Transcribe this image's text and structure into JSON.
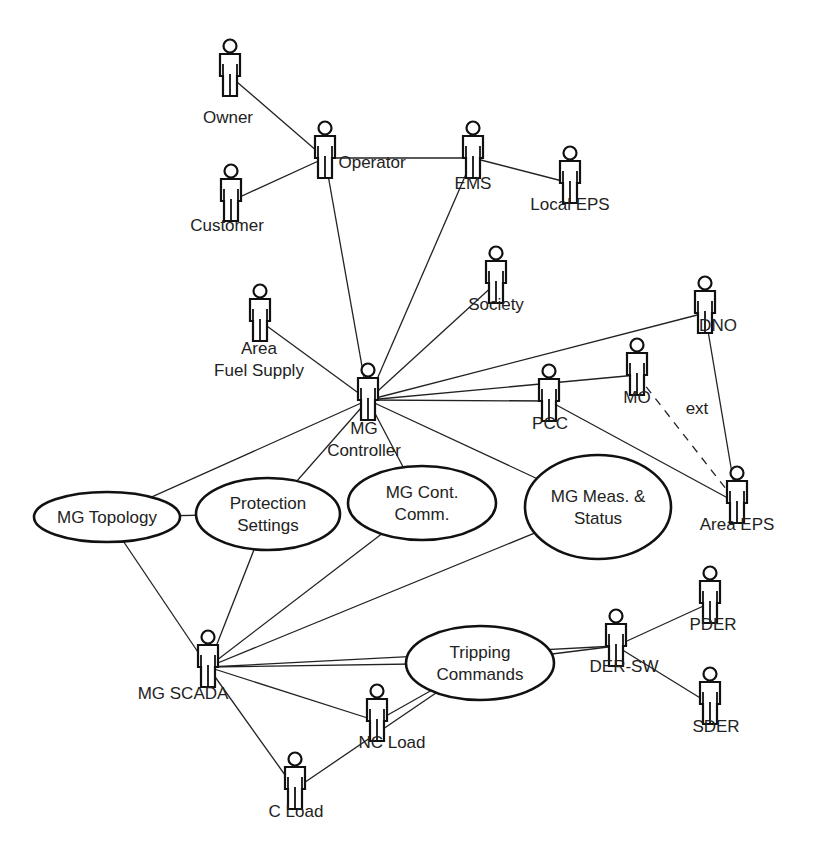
{
  "actors": [
    {
      "id": "owner",
      "label": [
        "Owner"
      ],
      "x": 230,
      "y": 38,
      "lx": 228,
      "ly": 123
    },
    {
      "id": "operator",
      "label": [
        "Operator"
      ],
      "x": 325,
      "y": 120,
      "lx": 372,
      "ly": 168
    },
    {
      "id": "customer",
      "label": [
        "Customer"
      ],
      "x": 231,
      "y": 163,
      "lx": 227,
      "ly": 231
    },
    {
      "id": "ems",
      "label": [
        "EMS"
      ],
      "x": 473,
      "y": 120,
      "lx": 473,
      "ly": 189
    },
    {
      "id": "local-eps",
      "label": [
        "Local EPS"
      ],
      "x": 570,
      "y": 145,
      "lx": 570,
      "ly": 210
    },
    {
      "id": "society",
      "label": [
        "Society"
      ],
      "x": 496,
      "y": 245,
      "lx": 496,
      "ly": 310
    },
    {
      "id": "dno",
      "label": [
        "DNO"
      ],
      "x": 705,
      "y": 275,
      "lx": 718,
      "ly": 331
    },
    {
      "id": "area-fuel-supply",
      "label": [
        "Area",
        "Fuel Supply"
      ],
      "x": 260,
      "y": 283,
      "lx": 259,
      "ly": 354
    },
    {
      "id": "mg-controller",
      "label": [
        "MG",
        "Controller"
      ],
      "x": 368,
      "y": 362,
      "lx": 364,
      "ly": 434
    },
    {
      "id": "mo",
      "label": [
        "MO"
      ],
      "x": 637,
      "y": 337,
      "lx": 637,
      "ly": 403
    },
    {
      "id": "pcc",
      "label": [
        "PCC"
      ],
      "x": 549,
      "y": 363,
      "lx": 550,
      "ly": 429
    },
    {
      "id": "area-eps",
      "label": [
        "Area EPS"
      ],
      "x": 737,
      "y": 465,
      "lx": 737,
      "ly": 530
    },
    {
      "id": "pder",
      "label": [
        "PDER"
      ],
      "x": 710,
      "y": 565,
      "lx": 713,
      "ly": 630
    },
    {
      "id": "mg-scada",
      "label": [
        "MG SCADA"
      ],
      "x": 208,
      "y": 629,
      "lx": 183,
      "ly": 699
    },
    {
      "id": "der-sw",
      "label": [
        "DER-SW"
      ],
      "x": 616,
      "y": 608,
      "lx": 624,
      "ly": 672
    },
    {
      "id": "nc-load",
      "label": [
        "NC Load"
      ],
      "x": 377,
      "y": 683,
      "lx": 392,
      "ly": 748
    },
    {
      "id": "sder",
      "label": [
        "SDER"
      ],
      "x": 710,
      "y": 666,
      "lx": 716,
      "ly": 732
    },
    {
      "id": "c-load",
      "label": [
        "C Load"
      ],
      "x": 295,
      "y": 751,
      "lx": 296,
      "ly": 817
    }
  ],
  "use_cases": [
    {
      "id": "mg-topology",
      "label": [
        "MG Topology"
      ],
      "cx": 107,
      "cy": 517,
      "rx": 73,
      "ry": 25
    },
    {
      "id": "protection-settings",
      "label": [
        "Protection",
        "Settings"
      ],
      "cx": 268,
      "cy": 514,
      "rx": 72,
      "ry": 36
    },
    {
      "id": "mg-cont-comm",
      "label": [
        "MG Cont.",
        "Comm."
      ],
      "cx": 422,
      "cy": 503,
      "rx": 74,
      "ry": 37
    },
    {
      "id": "mg-meas-status",
      "label": [
        "MG Meas. &",
        "Status"
      ],
      "cx": 598,
      "cy": 507,
      "rx": 73,
      "ry": 52
    },
    {
      "id": "tripping-commands",
      "label": [
        "Tripping",
        "Commands"
      ],
      "cx": 480,
      "cy": 663,
      "rx": 74,
      "ry": 37
    }
  ],
  "edges": [
    {
      "from": "owner",
      "to": "operator"
    },
    {
      "from": "customer",
      "to": "operator"
    },
    {
      "from": "operator",
      "to": "ems"
    },
    {
      "from": "ems",
      "to": "local-eps"
    },
    {
      "from": "operator",
      "to": "mg-controller"
    },
    {
      "from": "ems",
      "to": "mg-controller"
    },
    {
      "from": "society",
      "to": "mg-controller"
    },
    {
      "from": "area-fuel-supply",
      "to": "mg-controller"
    },
    {
      "from": "dno",
      "to": "mg-controller"
    },
    {
      "from": "mo",
      "to": "mg-controller"
    },
    {
      "from": "pcc",
      "to": "mg-controller"
    },
    {
      "from": "dno",
      "to": "area-eps"
    },
    {
      "from": "pcc",
      "to": "area-eps"
    },
    {
      "from": "mo",
      "to": "area-eps",
      "style": "dashed",
      "label": "ext"
    },
    {
      "from": "mg-controller",
      "to": "mg-topology"
    },
    {
      "from": "mg-controller",
      "to": "protection-settings"
    },
    {
      "from": "mg-controller",
      "to": "mg-cont-comm"
    },
    {
      "from": "mg-controller",
      "to": "mg-meas-status"
    },
    {
      "from": "mg-topology",
      "to": "protection-settings"
    },
    {
      "from": "mg-topology",
      "to": "mg-scada"
    },
    {
      "from": "protection-settings",
      "to": "mg-scada"
    },
    {
      "from": "mg-cont-comm",
      "to": "mg-scada"
    },
    {
      "from": "mg-meas-status",
      "to": "mg-scada"
    },
    {
      "from": "mg-scada",
      "to": "der-sw"
    },
    {
      "from": "mg-scada",
      "to": "tripping-commands"
    },
    {
      "from": "mg-scada",
      "to": "nc-load"
    },
    {
      "from": "mg-scada",
      "to": "c-load"
    },
    {
      "from": "tripping-commands",
      "to": "der-sw"
    },
    {
      "from": "tripping-commands",
      "to": "nc-load"
    },
    {
      "from": "tripping-commands",
      "to": "c-load"
    },
    {
      "from": "der-sw",
      "to": "pder"
    },
    {
      "from": "der-sw",
      "to": "sder"
    }
  ],
  "ext_label": {
    "text": "ext",
    "x": 697,
    "y": 414
  }
}
